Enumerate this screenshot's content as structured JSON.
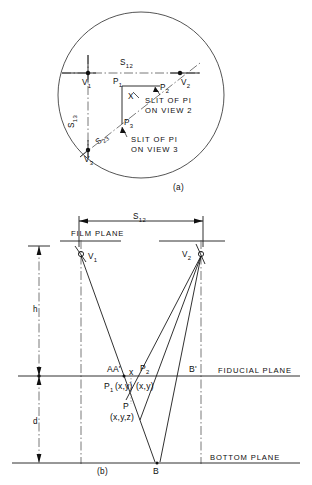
{
  "figure": {
    "caption_a": "(a)",
    "caption_b": "(b)",
    "panel_a": {
      "name": "plan-view-circle",
      "vertices": [
        {
          "id": "V1",
          "base": "V",
          "sub": "1"
        },
        {
          "id": "V2",
          "base": "V",
          "sub": "2"
        },
        {
          "id": "V3",
          "base": "V",
          "sub": "3"
        }
      ],
      "points": [
        {
          "id": "P1",
          "base": "P",
          "sub": "1"
        },
        {
          "id": "P2",
          "base": "P",
          "sub": "2"
        },
        {
          "id": "P3",
          "base": "P",
          "sub": "3"
        },
        {
          "id": "X",
          "base": "X",
          "sub": ""
        }
      ],
      "baselines": [
        {
          "id": "S12",
          "base": "S",
          "sub": "12"
        },
        {
          "id": "S13",
          "base": "S",
          "sub": "13"
        },
        {
          "id": "S23",
          "base": "S",
          "sub": "23"
        }
      ],
      "annotations": [
        {
          "line1": "SLIT OF PI",
          "line2": "ON VIEW 2"
        },
        {
          "line1": "SLIT OF PI",
          "line2": "ON VIEW 3"
        }
      ]
    },
    "panel_b": {
      "name": "elevation-view",
      "planes": [
        {
          "id": "film",
          "label": "FILM PLANE"
        },
        {
          "id": "fiducial",
          "label": "FIDUCIAL PLANE"
        },
        {
          "id": "bottom",
          "label": "BOTTOM PLANE"
        }
      ],
      "dimensions": [
        {
          "id": "S12",
          "base": "S",
          "sub": "12"
        },
        {
          "id": "h",
          "base": "h",
          "sub": ""
        },
        {
          "id": "d",
          "base": "d",
          "sub": ""
        }
      ],
      "vertices": [
        {
          "id": "V1",
          "base": "V",
          "sub": "1"
        },
        {
          "id": "V2",
          "base": "V",
          "sub": "2"
        }
      ],
      "points": [
        {
          "id": "AA",
          "text": "AA'"
        },
        {
          "id": "Bprime",
          "text": "B'"
        },
        {
          "id": "B",
          "text": "B"
        },
        {
          "id": "X",
          "text": "x"
        },
        {
          "id": "P1",
          "base": "P",
          "sub": "1",
          "coords": "(x,y)"
        },
        {
          "id": "P2",
          "base": "P",
          "sub": "2",
          "coords": "(x,y)"
        },
        {
          "id": "P",
          "base": "P",
          "sub": "",
          "coords": "(x,y,z)"
        }
      ]
    },
    "colors": {
      "ink": "#1a1a1a",
      "circle": "#555555",
      "centerline": "#555555",
      "background": "#ffffff"
    }
  }
}
